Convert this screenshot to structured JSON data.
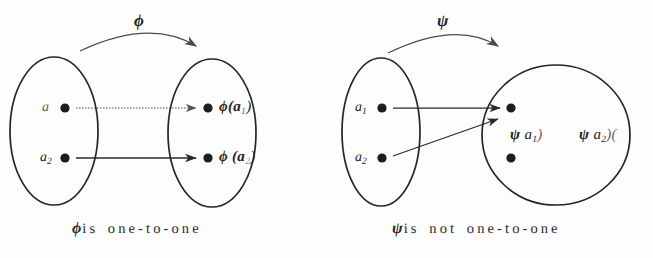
{
  "figure": {
    "background_color": "#fdfdfd",
    "ink_color": "#232323",
    "panels": [
      {
        "id": "injective",
        "map_symbol": "ϕ",
        "caption_symbol": "ϕ",
        "caption_text": "is one-to-one",
        "domain": {
          "shape": "ellipse",
          "elements": [
            {
              "label": "a",
              "subscript": "",
              "dot": true
            },
            {
              "label": "a",
              "subscript": "2",
              "dot": true
            }
          ]
        },
        "codomain": {
          "shape": "ellipse",
          "elements": [
            {
              "label": "ϕ(a",
              "subscript": "1",
              "tail": ")",
              "dot": true
            },
            {
              "label": "ϕ  (a",
              "subscript": "2",
              "tail": ")",
              "dot": true
            }
          ]
        },
        "arrows": [
          {
            "from": "a1",
            "to": "phi-a1",
            "style": "dotted"
          },
          {
            "from": "a2",
            "to": "phi-a2",
            "style": "solid"
          }
        ]
      },
      {
        "id": "noninjective",
        "map_symbol": "ψ",
        "caption_symbol": "ψ",
        "caption_text": "is not one-to-one",
        "domain": {
          "shape": "ellipse",
          "elements": [
            {
              "label": "a",
              "subscript": "1",
              "dot": true
            },
            {
              "label": "a",
              "subscript": "2",
              "dot": true
            }
          ]
        },
        "codomain": {
          "shape": "circle",
          "elements": [
            {
              "label": "",
              "subscript": "",
              "dot": true
            },
            {
              "label": "",
              "subscript": "",
              "dot": true
            }
          ],
          "image_labels": [
            {
              "text_head": "ψ",
              "text_body": " a",
              "subscript": "1",
              "tail": ")"
            },
            {
              "text_head": "ψ",
              "text_body": " a",
              "subscript": "2",
              "tail": ")("
            }
          ]
        },
        "arrows": [
          {
            "from": "a1",
            "to": "psi-image",
            "style": "solid"
          },
          {
            "from": "a2",
            "to": "psi-image",
            "style": "solid"
          }
        ]
      }
    ]
  },
  "labels": {
    "phi_symbol": "ϕ",
    "psi_symbol": "ψ",
    "a_plain": "a",
    "a_sub1": "1",
    "a_sub2": "2",
    "phi_a1_head": "ϕ(a",
    "phi_a1_tail": ")",
    "phi_a2_head": "ϕ  (a",
    "phi_a2_tail": ")",
    "psi_a1_head": "ψ",
    "psi_a1_body": " a",
    "psi_a1_tail": ")",
    "psi_a2_head": "ψ",
    "psi_a2_body": " a",
    "psi_a2_tail": ")(",
    "caption_left_text": "is one-to-one",
    "caption_right_text": "is not one-to-one"
  }
}
